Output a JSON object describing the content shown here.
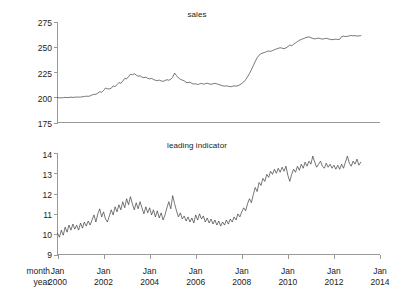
{
  "figure": {
    "background_color": "#ffffff",
    "axis_color": "#9a9a9a",
    "line_color": "#3c3c3c",
    "row_label_month": "month",
    "row_label_year": "year"
  },
  "chart_data": [
    {
      "type": "line",
      "title": "sales",
      "xlabel": "",
      "ylabel": "",
      "grid": false,
      "legend": "none",
      "ylim": [
        175,
        275
      ],
      "yticks": [
        175,
        200,
        225,
        250,
        275
      ],
      "ytick_labels": [
        "175",
        "200",
        "225",
        "250",
        "275"
      ],
      "xlim": [
        2000.0,
        2014.0
      ],
      "xticks": [
        2000,
        2002,
        2004,
        2006,
        2008,
        2010,
        2012,
        2014
      ],
      "xtick_labels": [
        "Jan\n2000",
        "Jan\n2002",
        "Jan\n2004",
        "Jan\n2006",
        "Jan\n2008",
        "Jan\n2010",
        "Jan\n2012",
        "Jan\n2014"
      ],
      "x_start": 2000.0,
      "x_step": 0.0833333,
      "values": [
        199.8,
        199.6,
        199.5,
        199.7,
        200.0,
        199.8,
        199.9,
        200.2,
        200.0,
        200.1,
        200.4,
        200.2,
        200.3,
        200.6,
        200.9,
        201.2,
        201.0,
        201.5,
        202.4,
        203.1,
        203.0,
        204.2,
        205.6,
        205.1,
        206.9,
        209.3,
        208.6,
        208.4,
        209.1,
        211.4,
        210.8,
        212.6,
        214.8,
        214.0,
        216.2,
        218.9,
        218.4,
        220.6,
        223.1,
        222.4,
        223.6,
        222.2,
        221.0,
        221.5,
        220.2,
        219.6,
        220.1,
        219.0,
        218.4,
        218.8,
        217.9,
        217.0,
        216.6,
        217.2,
        216.4,
        215.9,
        216.8,
        217.6,
        217.0,
        218.1,
        220.0,
        224.2,
        221.6,
        219.3,
        218.0,
        217.2,
        216.4,
        215.0,
        214.6,
        215.2,
        213.9,
        213.2,
        213.6,
        212.8,
        213.4,
        213.9,
        213.2,
        213.6,
        214.1,
        213.4,
        213.0,
        213.5,
        214.0,
        213.4,
        212.8,
        212.2,
        211.6,
        211.2,
        211.5,
        211.0,
        210.6,
        211.0,
        211.4,
        211.2,
        211.6,
        212.6,
        213.8,
        215.4,
        217.6,
        220.4,
        223.8,
        227.4,
        231.6,
        235.8,
        239.4,
        242.0,
        243.4,
        244.2,
        244.8,
        245.6,
        246.2,
        245.8,
        246.6,
        247.4,
        248.2,
        248.8,
        249.4,
        249.0,
        248.4,
        249.2,
        250.6,
        252.0,
        251.4,
        252.8,
        254.2,
        255.6,
        256.8,
        257.6,
        258.4,
        259.2,
        259.8,
        260.2,
        259.4,
        258.6,
        258.2,
        258.6,
        259.0,
        258.4,
        258.0,
        258.4,
        258.8,
        258.2,
        257.8,
        257.4,
        257.6,
        258.0,
        257.6,
        257.8,
        260.4,
        261.0,
        260.4,
        260.8,
        261.2,
        261.6,
        261.2,
        261.4,
        261.0,
        261.2,
        261.4
      ]
    },
    {
      "type": "line",
      "title": "leading indicator",
      "xlabel": "",
      "ylabel": "",
      "grid": false,
      "legend": "none",
      "ylim": [
        9,
        14
      ],
      "yticks": [
        9,
        10,
        11,
        12,
        13,
        14
      ],
      "ytick_labels": [
        "9",
        "10",
        "11",
        "12",
        "13",
        "14"
      ],
      "xlim": [
        2000.0,
        2014.0
      ],
      "xticks": [
        2000,
        2002,
        2004,
        2006,
        2008,
        2010,
        2012,
        2014
      ],
      "xtick_labels": [
        "Jan\n2000",
        "Jan\n2002",
        "Jan\n2004",
        "Jan\n2006",
        "Jan\n2008",
        "Jan\n2010",
        "Jan\n2012",
        "Jan\n2014"
      ],
      "x_start": 2000.0,
      "x_step": 0.0833333,
      "values": [
        10.05,
        9.85,
        10.2,
        9.95,
        10.35,
        10.1,
        10.45,
        10.2,
        10.5,
        10.25,
        10.45,
        10.2,
        10.55,
        10.3,
        10.6,
        10.4,
        10.65,
        10.45,
        10.7,
        10.95,
        10.6,
        11.0,
        11.25,
        10.85,
        11.1,
        10.75,
        10.6,
        10.9,
        11.2,
        10.95,
        11.35,
        11.1,
        11.45,
        11.2,
        11.6,
        11.3,
        11.75,
        11.45,
        11.85,
        11.5,
        11.2,
        11.55,
        11.25,
        11.6,
        11.3,
        11.0,
        11.35,
        11.05,
        11.3,
        10.95,
        11.2,
        10.85,
        11.15,
        10.8,
        11.05,
        10.7,
        10.95,
        11.3,
        11.6,
        11.25,
        11.9,
        11.5,
        11.15,
        10.85,
        11.05,
        10.75,
        10.9,
        10.65,
        10.85,
        10.6,
        10.8,
        10.55,
        10.95,
        10.7,
        11.0,
        10.75,
        10.9,
        10.6,
        10.8,
        10.55,
        10.75,
        10.5,
        10.7,
        10.45,
        10.65,
        10.4,
        10.6,
        10.45,
        10.7,
        10.5,
        10.75,
        10.6,
        10.85,
        10.7,
        11.0,
        10.85,
        11.1,
        11.3,
        11.15,
        11.5,
        11.75,
        11.55,
        11.95,
        12.3,
        12.1,
        12.55,
        12.4,
        12.75,
        12.6,
        12.95,
        12.8,
        13.1,
        12.95,
        13.2,
        13.0,
        13.25,
        13.05,
        13.3,
        13.1,
        13.35,
        12.9,
        12.6,
        12.95,
        13.2,
        13.05,
        13.35,
        13.15,
        13.45,
        13.25,
        13.55,
        13.35,
        13.6,
        13.45,
        13.85,
        13.55,
        13.3,
        13.45,
        13.6,
        13.35,
        13.25,
        13.5,
        13.3,
        13.45,
        13.25,
        13.4,
        13.2,
        13.4,
        13.2,
        13.45,
        13.25,
        13.55,
        13.85,
        13.5,
        13.35,
        13.6,
        13.45,
        13.7,
        13.4,
        13.55
      ]
    }
  ]
}
